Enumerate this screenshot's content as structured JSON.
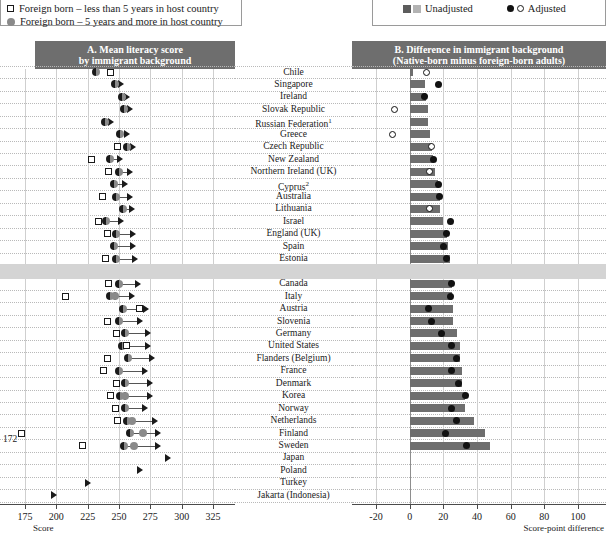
{
  "legend_left": {
    "items": [
      {
        "marker": "half-circle",
        "label": "Native born"
      },
      {
        "marker": "open-square",
        "label": "Foreign born – less than 5 years in host country"
      },
      {
        "marker": "grey-circle",
        "label": "Foreign born – 5 years and more in host country"
      }
    ]
  },
  "legend_right": {
    "items": [
      {
        "markers": [
          "dark-square",
          "light-square"
        ],
        "label": "Unadjusted"
      },
      {
        "markers": [
          "filled-circle",
          "open-circle"
        ],
        "label": "Adjusted"
      }
    ]
  },
  "panel_a": {
    "title": "A. Mean literacy score",
    "subtitle": "by immigrant background",
    "axis_label": "Score",
    "ticks": [
      175,
      200,
      225,
      250,
      275,
      300,
      325
    ],
    "off_scale_note": "172"
  },
  "panel_b": {
    "title": "B. Difference in immigrant background",
    "subtitle": "(Native-born minus foreign-born adults)",
    "axis_label": "Score-point difference",
    "ticks": [
      -20,
      0,
      20,
      40,
      60,
      80,
      100
    ]
  },
  "chart_data": {
    "type": "bar",
    "xlabel": "Score / Score-point difference",
    "ylabel": "",
    "panelA": {
      "type": "scatter",
      "xlabel": "Score",
      "xlim": [
        175,
        325
      ],
      "ticks": [
        175,
        200,
        225,
        250,
        275,
        300,
        325
      ],
      "series": [
        "Native born",
        "Foreign born – less than 5 years in host country",
        "Foreign born – 5 years and more in host country"
      ]
    },
    "panelB": {
      "type": "bar",
      "xlabel": "Score-point difference",
      "xlim": [
        -20,
        100
      ],
      "ticks": [
        -20,
        0,
        20,
        40,
        60,
        80,
        100
      ],
      "series": [
        "Unadjusted",
        "Adjusted"
      ]
    },
    "categories": [
      "Chile",
      "Singapore",
      "Ireland",
      "Slovak Republic",
      "Russian Federation",
      "Greece",
      "Czech Republic",
      "New Zealand",
      "Northern Ireland (UK)",
      "Cyprus",
      "Australia",
      "Lithuania",
      "Israel",
      "England (UK)",
      "Spain",
      "Estonia",
      "OECD average",
      "Canada",
      "Italy",
      "Austria",
      "Slovenia",
      "Germany",
      "United States",
      "Flanders (Belgium)",
      "France",
      "Denmark",
      "Korea",
      "Norway",
      "Netherlands",
      "Finland",
      "Sweden",
      "Japan",
      "Poland",
      "Turkey",
      "Jakarta (Indonesia)"
    ],
    "rows": [
      {
        "country": "Chile",
        "footnote": null,
        "bold": false,
        "native": 232,
        "fb_lt5": 243,
        "fb_ge5": null,
        "arrow_from": null,
        "arrow_to": null,
        "unadjusted": 2,
        "adjusted": 10,
        "adjusted_open": true
      },
      {
        "country": "Singapore",
        "footnote": null,
        "bold": false,
        "native": 247,
        "fb_lt5": null,
        "fb_ge5": null,
        "arrow_from": 247,
        "arrow_to": 253,
        "unadjusted": 9,
        "adjusted": 17,
        "adjusted_open": false
      },
      {
        "country": "Ireland",
        "footnote": null,
        "bold": false,
        "native": 252,
        "fb_lt5": null,
        "fb_ge5": null,
        "arrow_from": 252,
        "arrow_to": 258,
        "unadjusted": 10,
        "adjusted": 9,
        "adjusted_open": false
      },
      {
        "country": "Slovak Republic",
        "footnote": null,
        "bold": false,
        "native": 254,
        "fb_lt5": null,
        "fb_ge5": null,
        "arrow_from": 254,
        "arrow_to": 260,
        "unadjusted": 11,
        "adjusted": -9,
        "adjusted_open": true
      },
      {
        "country": "Russian Federation",
        "footnote": "1",
        "bold": false,
        "native": 239,
        "fb_lt5": null,
        "fb_ge5": null,
        "arrow_from": 239,
        "arrow_to": 245,
        "unadjusted": 11,
        "adjusted": null,
        "adjusted_open": false
      },
      {
        "country": "Greece",
        "footnote": null,
        "bold": false,
        "native": 251,
        "fb_lt5": null,
        "fb_ge5": null,
        "arrow_from": 251,
        "arrow_to": 258,
        "unadjusted": 12,
        "adjusted": -10,
        "adjusted_open": true
      },
      {
        "country": "Czech Republic",
        "footnote": null,
        "bold": false,
        "native": 256,
        "fb_lt5": 249,
        "fb_ge5": null,
        "arrow_from": 256,
        "arrow_to": 263,
        "unadjusted": 13,
        "adjusted": 13,
        "adjusted_open": true
      },
      {
        "country": "New Zealand",
        "footnote": null,
        "bold": false,
        "native": 243,
        "fb_lt5": 228,
        "fb_ge5": null,
        "arrow_from": 243,
        "arrow_to": 252,
        "unadjusted": 14,
        "adjusted": 14,
        "adjusted_open": false
      },
      {
        "country": "Northern Ireland (UK)",
        "footnote": null,
        "bold": false,
        "native": 250,
        "fb_lt5": 242,
        "fb_ge5": null,
        "arrow_from": 250,
        "arrow_to": 260,
        "unadjusted": 15,
        "adjusted": 12,
        "adjusted_open": true
      },
      {
        "country": "Cyprus",
        "footnote": "2",
        "bold": false,
        "native": 246,
        "fb_lt5": null,
        "fb_ge5": null,
        "arrow_from": 246,
        "arrow_to": 256,
        "unadjusted": 17,
        "adjusted": 17,
        "adjusted_open": false
      },
      {
        "country": "Australia",
        "footnote": null,
        "bold": false,
        "native": 248,
        "fb_lt5": 237,
        "fb_ge5": null,
        "arrow_from": 248,
        "arrow_to": 260,
        "unadjusted": 18,
        "adjusted": 18,
        "adjusted_open": false
      },
      {
        "country": "Lithuania",
        "footnote": null,
        "bold": false,
        "native": 253,
        "fb_lt5": null,
        "fb_ge5": null,
        "arrow_from": 253,
        "arrow_to": 262,
        "unadjusted": 18,
        "adjusted": 12,
        "adjusted_open": true
      },
      {
        "country": "Israel",
        "footnote": null,
        "bold": false,
        "native": 240,
        "fb_lt5": 234,
        "fb_ge5": null,
        "arrow_from": 240,
        "arrow_to": 253,
        "unadjusted": 20,
        "adjusted": 24,
        "adjusted_open": false
      },
      {
        "country": "England (UK)",
        "footnote": null,
        "bold": false,
        "native": 248,
        "fb_lt5": 241,
        "fb_ge5": null,
        "arrow_from": 248,
        "arrow_to": 263,
        "unadjusted": 22,
        "adjusted": 22,
        "adjusted_open": false
      },
      {
        "country": "Spain",
        "footnote": null,
        "bold": false,
        "native": 246,
        "fb_lt5": null,
        "fb_ge5": null,
        "arrow_from": 246,
        "arrow_to": 263,
        "unadjusted": 23,
        "adjusted": 20,
        "adjusted_open": false
      },
      {
        "country": "Estonia",
        "footnote": null,
        "bold": false,
        "native": 248,
        "fb_lt5": 239,
        "fb_ge5": null,
        "arrow_from": 248,
        "arrow_to": 264,
        "unadjusted": 24,
        "adjusted": 22,
        "adjusted_open": false
      },
      {
        "country": "OECD average",
        "footnote": null,
        "bold": true,
        "native": 247,
        "fb_lt5": 238,
        "fb_ge5": null,
        "arrow_from": 247,
        "arrow_to": 264,
        "unadjusted": 24,
        "adjusted": 20,
        "adjusted_open": false
      },
      {
        "country": "Canada",
        "footnote": null,
        "bold": false,
        "native": 250,
        "fb_lt5": 242,
        "fb_ge5": null,
        "arrow_from": 250,
        "arrow_to": 267,
        "unadjusted": 25,
        "adjusted": 25,
        "adjusted_open": false
      },
      {
        "country": "Italy",
        "footnote": null,
        "bold": false,
        "native": 243,
        "fb_lt5": 207,
        "fb_ge5": 247,
        "arrow_from": 247,
        "arrow_to": 262,
        "unadjusted": 25,
        "adjusted": 24,
        "adjusted_open": false
      },
      {
        "country": "Austria",
        "footnote": null,
        "bold": false,
        "native": 253,
        "fb_lt5": 266,
        "fb_ge5": null,
        "arrow_from": 253,
        "arrow_to": 273,
        "unadjusted": 26,
        "adjusted": 11,
        "adjusted_open": false
      },
      {
        "country": "Slovenia",
        "footnote": null,
        "bold": false,
        "native": 250,
        "fb_lt5": 241,
        "fb_ge5": null,
        "arrow_from": 250,
        "arrow_to": 268,
        "unadjusted": 26,
        "adjusted": 13,
        "adjusted_open": false
      },
      {
        "country": "Germany",
        "footnote": null,
        "bold": false,
        "native": 255,
        "fb_lt5": 248,
        "fb_ge5": null,
        "arrow_from": 255,
        "arrow_to": 275,
        "unadjusted": 28,
        "adjusted": 19,
        "adjusted_open": false
      },
      {
        "country": "United States",
        "footnote": null,
        "bold": false,
        "native": 252,
        "fb_lt5": 256,
        "fb_ge5": null,
        "arrow_from": 252,
        "arrow_to": 275,
        "unadjusted": 30,
        "adjusted": 25,
        "adjusted_open": false
      },
      {
        "country": "Flanders (Belgium)",
        "footnote": null,
        "bold": false,
        "native": 257,
        "fb_lt5": 241,
        "fb_ge5": null,
        "arrow_from": 257,
        "arrow_to": 278,
        "unadjusted": 30,
        "adjusted": 28,
        "adjusted_open": false
      },
      {
        "country": "France",
        "footnote": null,
        "bold": false,
        "native": 250,
        "fb_lt5": 238,
        "fb_ge5": null,
        "arrow_from": 250,
        "arrow_to": 272,
        "unadjusted": 31,
        "adjusted": 25,
        "adjusted_open": false
      },
      {
        "country": "Denmark",
        "footnote": null,
        "bold": false,
        "native": 255,
        "fb_lt5": 248,
        "fb_ge5": null,
        "arrow_from": 255,
        "arrow_to": 276,
        "unadjusted": 31,
        "adjusted": 29,
        "adjusted_open": false
      },
      {
        "country": "Korea",
        "footnote": null,
        "bold": false,
        "native": 251,
        "fb_lt5": 243,
        "fb_ge5": 255,
        "arrow_from": 255,
        "arrow_to": 276,
        "unadjusted": 33,
        "adjusted": 33,
        "adjusted_open": false
      },
      {
        "country": "Norway",
        "footnote": null,
        "bold": false,
        "native": 255,
        "fb_lt5": 247,
        "fb_ge5": null,
        "arrow_from": 255,
        "arrow_to": 272,
        "unadjusted": 33,
        "adjusted": 25,
        "adjusted_open": false
      },
      {
        "country": "Netherlands",
        "footnote": null,
        "bold": false,
        "native": 256,
        "fb_lt5": 249,
        "fb_ge5": 260,
        "arrow_from": 256,
        "arrow_to": 280,
        "unadjusted": 38,
        "adjusted": 28,
        "adjusted_open": false
      },
      {
        "country": "Finland",
        "footnote": null,
        "bold": false,
        "native": 259,
        "fb_lt5": 172,
        "fb_ge5": 269,
        "arrow_from": 259,
        "arrow_to": 283,
        "unadjusted": 45,
        "adjusted": 21,
        "adjusted_open": false
      },
      {
        "country": "Sweden",
        "footnote": null,
        "bold": false,
        "native": 254,
        "fb_lt5": 221,
        "fb_ge5": 262,
        "arrow_from": 254,
        "arrow_to": 283,
        "unadjusted": 48,
        "adjusted": 34,
        "adjusted_open": false
      },
      {
        "country": "Japan",
        "footnote": null,
        "bold": false,
        "native": null,
        "fb_lt5": null,
        "fb_ge5": null,
        "arrow_from": null,
        "arrow_to": 291,
        "unadjusted": null,
        "adjusted": null,
        "adjusted_open": false
      },
      {
        "country": "Poland",
        "footnote": null,
        "bold": false,
        "native": null,
        "fb_lt5": null,
        "fb_ge5": null,
        "arrow_from": null,
        "arrow_to": 268,
        "unadjusted": null,
        "adjusted": null,
        "adjusted_open": false
      },
      {
        "country": "Turkey",
        "footnote": null,
        "bold": false,
        "native": null,
        "fb_lt5": null,
        "fb_ge5": null,
        "arrow_from": null,
        "arrow_to": 227,
        "unadjusted": null,
        "adjusted": null,
        "adjusted_open": false
      },
      {
        "country": "Jakarta (Indonesia)",
        "footnote": null,
        "bold": false,
        "native": null,
        "fb_lt5": null,
        "fb_ge5": null,
        "arrow_from": null,
        "arrow_to": 200,
        "unadjusted": null,
        "adjusted": null,
        "adjusted_open": false
      }
    ]
  }
}
